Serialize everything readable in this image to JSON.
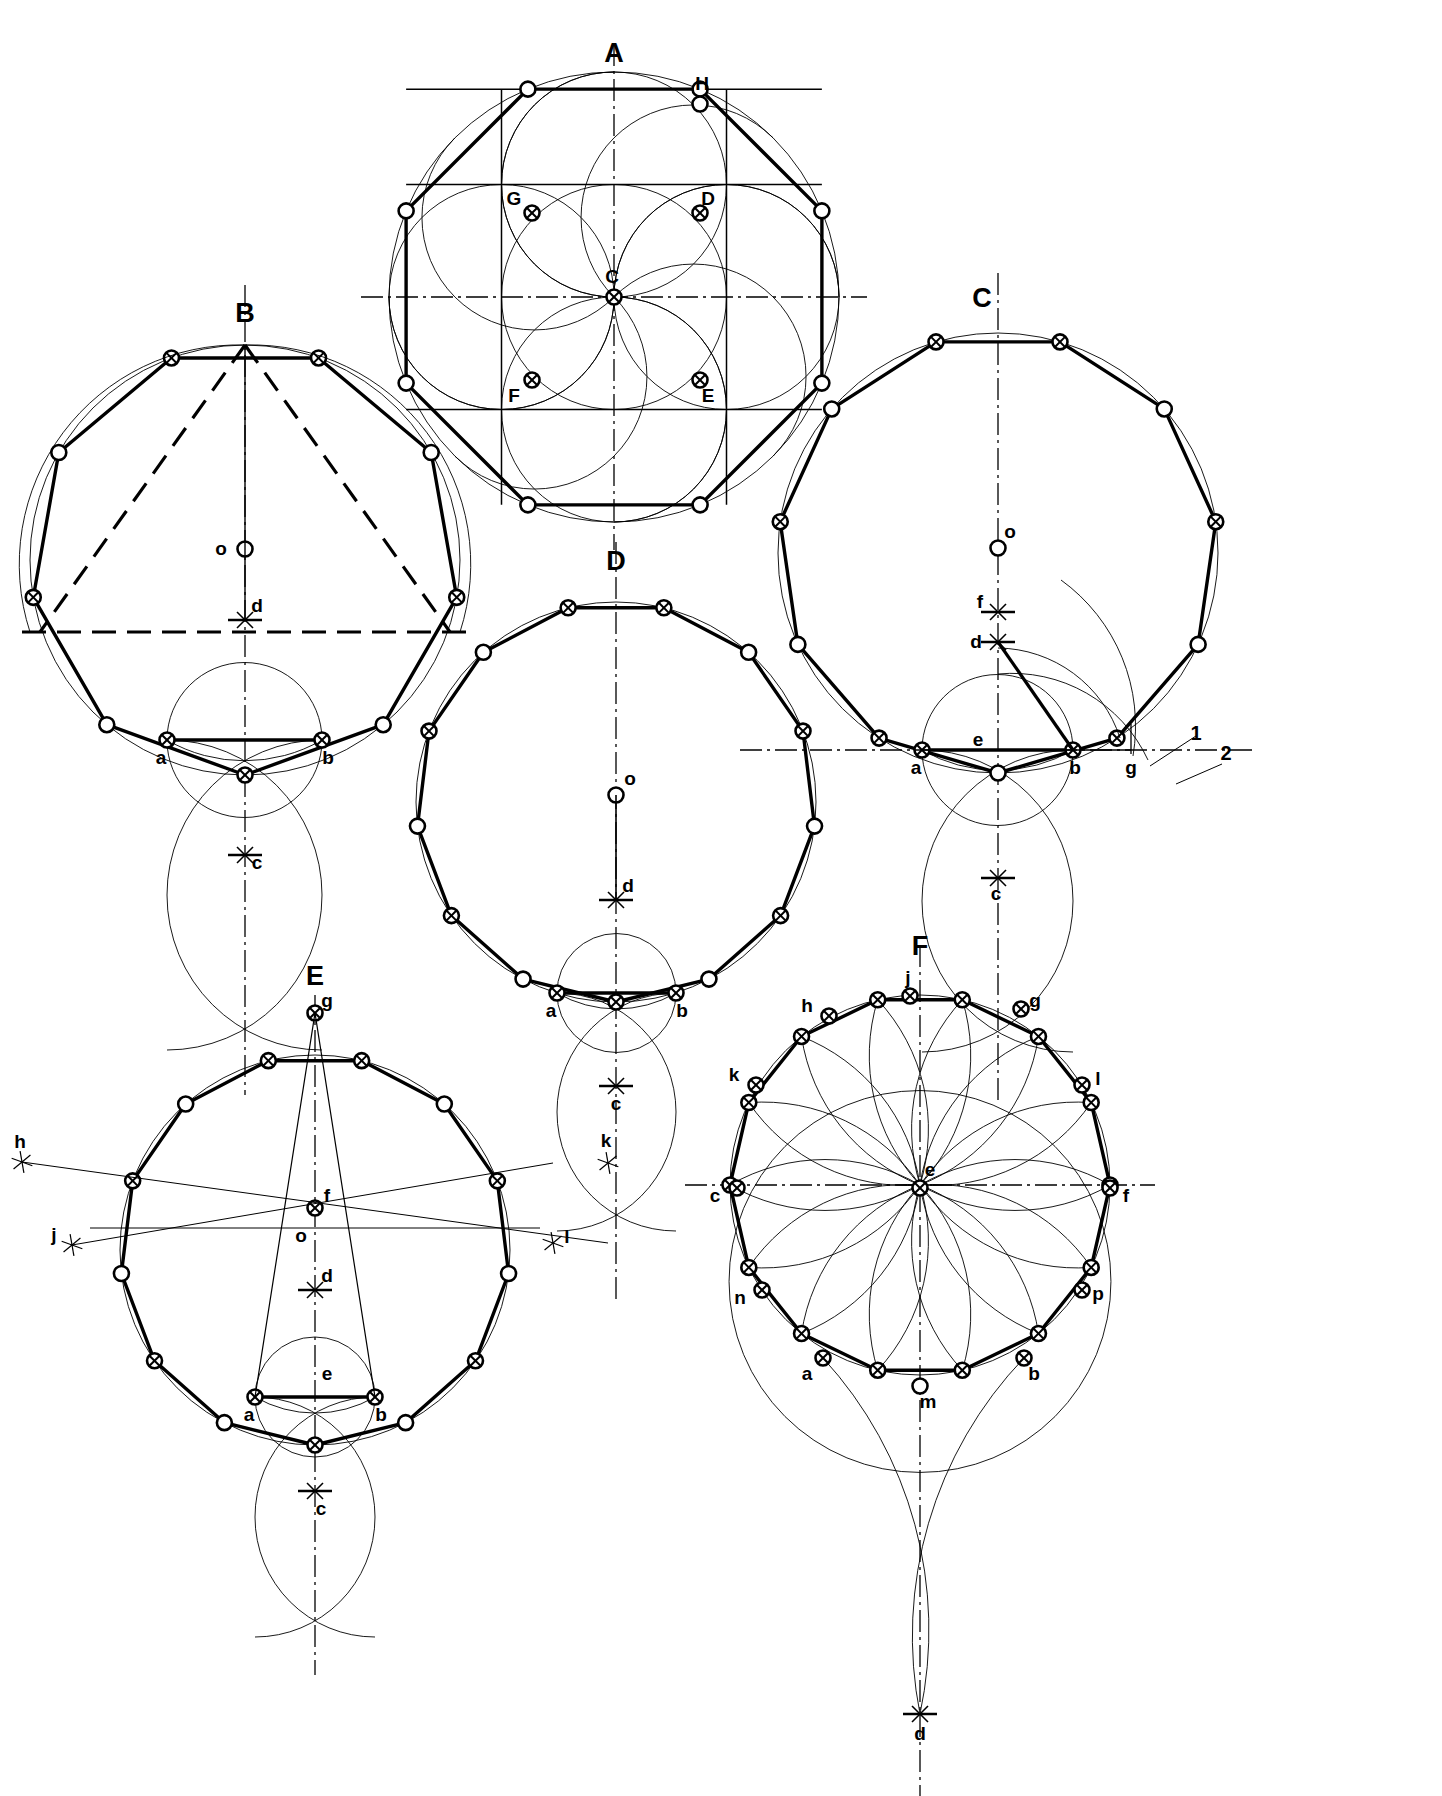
{
  "sheet": {
    "title_visible": false,
    "background": "#ffffff",
    "ink": "#000000",
    "width": 1442,
    "height": 1796,
    "description": "Technical drawing plate: six geometric constructions of regular polygons inscribed in circles, labelled A through F."
  },
  "figures": [
    {
      "id": "A",
      "label": "A",
      "label_pos": [
        614,
        62
      ],
      "polygon_sides": 8,
      "center": [
        614,
        297
      ],
      "radius": 225,
      "rotation_deg": 22.5,
      "construction": "octagon-in-circle-with-square-and-rosette",
      "points": [
        {
          "name": "C",
          "label": "C",
          "x": 614,
          "y": 297,
          "label_dx": -2,
          "label_dy": -14,
          "marker": "crossed"
        },
        {
          "name": "D",
          "label": "D",
          "x": 700,
          "y": 213,
          "label_dx": 8,
          "label_dy": -8,
          "marker": "crossed"
        },
        {
          "name": "E",
          "label": "E",
          "x": 700,
          "y": 380,
          "label_dx": 8,
          "label_dy": 22,
          "marker": "crossed"
        },
        {
          "name": "F",
          "label": "F",
          "x": 532,
          "y": 380,
          "label_dx": -18,
          "label_dy": 22,
          "marker": "crossed"
        },
        {
          "name": "G",
          "label": "G",
          "x": 532,
          "y": 213,
          "label_dx": -18,
          "label_dy": -8,
          "marker": "crossed"
        },
        {
          "name": "H",
          "label": "H",
          "x": 700,
          "y": 104,
          "label_dx": 2,
          "label_dy": -14,
          "marker": "open"
        }
      ]
    },
    {
      "id": "B",
      "label": "B",
      "label_pos": [
        245,
        322
      ],
      "polygon_sides": 9,
      "center": [
        245,
        560
      ],
      "radius": 215,
      "rotation_deg": -90,
      "construction": "nonagon-from-base-ab-and-arc-intersections",
      "points": [
        {
          "name": "o",
          "label": "o",
          "x": 245,
          "y": 549,
          "label_dx": -24,
          "label_dy": 6,
          "marker": "open"
        },
        {
          "name": "d",
          "label": "d",
          "x": 245,
          "y": 620,
          "label_dx": 12,
          "label_dy": -8,
          "marker": "cross-tick"
        },
        {
          "name": "a",
          "label": "a",
          "x": 167,
          "y": 740,
          "label_dx": -6,
          "label_dy": 24,
          "marker": "crossed"
        },
        {
          "name": "b",
          "label": "b",
          "x": 322,
          "y": 740,
          "label_dx": 6,
          "label_dy": 24,
          "marker": "crossed"
        },
        {
          "name": "c",
          "label": "c",
          "x": 245,
          "y": 855,
          "label_dx": 12,
          "label_dy": 14,
          "marker": "cross-tick"
        }
      ]
    },
    {
      "id": "C",
      "label": "C",
      "label_pos": [
        982,
        307
      ],
      "polygon_sides": 11,
      "center": [
        998,
        553
      ],
      "radius": 220,
      "rotation_deg": -90,
      "construction": "hendecagon-with-angle-bisector-and-numbered-arcs",
      "points": [
        {
          "name": "o",
          "label": "o",
          "x": 998,
          "y": 548,
          "label_dx": 12,
          "label_dy": -10,
          "marker": "open"
        },
        {
          "name": "f",
          "label": "f",
          "x": 998,
          "y": 612,
          "label_dx": -18,
          "label_dy": -4,
          "marker": "cross-tick"
        },
        {
          "name": "d",
          "label": "d",
          "x": 998,
          "y": 642,
          "label_dx": -22,
          "label_dy": 6,
          "marker": "cross-tick"
        },
        {
          "name": "e",
          "label": "e",
          "x": 998,
          "y": 750,
          "label_dx": -20,
          "label_dy": -4,
          "marker": "none"
        },
        {
          "name": "a",
          "label": "a",
          "x": 922,
          "y": 750,
          "label_dx": -6,
          "label_dy": 24,
          "marker": "crossed"
        },
        {
          "name": "b",
          "label": "b",
          "x": 1073,
          "y": 750,
          "label_dx": 2,
          "label_dy": 24,
          "marker": "crossed"
        },
        {
          "name": "g",
          "label": "g",
          "x": 1131,
          "y": 750,
          "label_dx": 0,
          "label_dy": 24,
          "marker": "none"
        },
        {
          "name": "c",
          "label": "c",
          "x": 998,
          "y": 878,
          "label_dx": -2,
          "label_dy": 22,
          "marker": "cross-tick"
        }
      ],
      "annotations": [
        {
          "name": "1",
          "label": "1",
          "x": 1196,
          "y": 740
        },
        {
          "name": "2",
          "label": "2",
          "x": 1226,
          "y": 760
        }
      ]
    },
    {
      "id": "D",
      "label": "D",
      "label_pos": [
        616,
        570
      ],
      "polygon_sides": 13,
      "center": [
        616,
        802
      ],
      "radius": 200,
      "rotation_deg": -90,
      "construction": "tridecagon-from-base-ab",
      "points": [
        {
          "name": "o",
          "label": "o",
          "x": 616,
          "y": 795,
          "label_dx": 14,
          "label_dy": -10,
          "marker": "open"
        },
        {
          "name": "d",
          "label": "d",
          "x": 616,
          "y": 900,
          "label_dx": 12,
          "label_dy": -8,
          "marker": "cross-tick"
        },
        {
          "name": "a",
          "label": "a",
          "x": 557,
          "y": 993,
          "label_dx": -6,
          "label_dy": 24,
          "marker": "crossed"
        },
        {
          "name": "b",
          "label": "b",
          "x": 676,
          "y": 993,
          "label_dx": 6,
          "label_dy": 24,
          "marker": "crossed"
        },
        {
          "name": "c",
          "label": "c",
          "x": 616,
          "y": 1086,
          "label_dx": 0,
          "label_dy": 24,
          "marker": "cross-tick"
        }
      ]
    },
    {
      "id": "E",
      "label": "E",
      "label_pos": [
        315,
        985
      ],
      "polygon_sides": 13,
      "center": [
        315,
        1250
      ],
      "radius": 195,
      "rotation_deg": -90,
      "construction": "polygon-with-external-ray-marks-h-j-k-l",
      "points": [
        {
          "name": "g",
          "label": "g",
          "x": 315,
          "y": 1013,
          "label_dx": 12,
          "label_dy": -6,
          "marker": "crossed"
        },
        {
          "name": "f",
          "label": "f",
          "x": 315,
          "y": 1208,
          "label_dx": 12,
          "label_dy": -6,
          "marker": "crossed"
        },
        {
          "name": "o",
          "label": "o",
          "x": 315,
          "y": 1228,
          "label_dx": -14,
          "label_dy": 14,
          "marker": "none"
        },
        {
          "name": "d",
          "label": "d",
          "x": 315,
          "y": 1290,
          "label_dx": 12,
          "label_dy": -8,
          "marker": "cross-tick"
        },
        {
          "name": "e",
          "label": "e",
          "x": 315,
          "y": 1382,
          "label_dx": 12,
          "label_dy": -2,
          "marker": "none"
        },
        {
          "name": "a",
          "label": "a",
          "x": 255,
          "y": 1397,
          "label_dx": -6,
          "label_dy": 24,
          "marker": "crossed"
        },
        {
          "name": "b",
          "label": "b",
          "x": 375,
          "y": 1397,
          "label_dx": 6,
          "label_dy": 24,
          "marker": "crossed"
        },
        {
          "name": "c",
          "label": "c",
          "x": 315,
          "y": 1491,
          "label_dx": 6,
          "label_dy": 24,
          "marker": "cross-tick"
        },
        {
          "name": "h",
          "label": "h",
          "x": 22,
          "y": 1162,
          "label_dx": -2,
          "label_dy": -14,
          "marker": "star"
        },
        {
          "name": "j",
          "label": "j",
          "x": 72,
          "y": 1245,
          "label_dx": -18,
          "label_dy": -4,
          "marker": "star"
        },
        {
          "name": "k",
          "label": "k",
          "x": 608,
          "y": 1163,
          "label_dx": -2,
          "label_dy": -16,
          "marker": "star"
        },
        {
          "name": "l",
          "label": "l",
          "x": 553,
          "y": 1243,
          "label_dx": 14,
          "label_dy": 0,
          "marker": "star"
        }
      ]
    },
    {
      "id": "F",
      "label": "F",
      "label_pos": [
        920,
        955
      ],
      "polygon_sides": 14,
      "center": [
        920,
        1185
      ],
      "radius": 190,
      "rotation_deg": -90,
      "construction": "tetradecagon-rosette-from-centre-e",
      "points": [
        {
          "name": "j",
          "label": "j",
          "x": 910,
          "y": 996,
          "label_dx": -2,
          "label_dy": -12,
          "marker": "crossed"
        },
        {
          "name": "h",
          "label": "h",
          "x": 829,
          "y": 1016,
          "label_dx": -22,
          "label_dy": -4,
          "marker": "crossed"
        },
        {
          "name": "g",
          "label": "g",
          "x": 1021,
          "y": 1009,
          "label_dx": 14,
          "label_dy": -2,
          "marker": "crossed"
        },
        {
          "name": "k",
          "label": "k",
          "x": 756,
          "y": 1085,
          "label_dx": -22,
          "label_dy": -4,
          "marker": "crossed"
        },
        {
          "name": "l",
          "label": "l",
          "x": 1082,
          "y": 1085,
          "label_dx": 16,
          "label_dy": 0,
          "marker": "crossed"
        },
        {
          "name": "c",
          "label": "c",
          "x": 737,
          "y": 1188,
          "label_dx": -22,
          "label_dy": 14,
          "marker": "crossed"
        },
        {
          "name": "f",
          "label": "f",
          "x": 1110,
          "y": 1188,
          "label_dx": 16,
          "label_dy": 14,
          "marker": "crossed"
        },
        {
          "name": "e",
          "label": "e",
          "x": 920,
          "y": 1188,
          "label_dx": 10,
          "label_dy": -12,
          "marker": "crossed"
        },
        {
          "name": "n",
          "label": "n",
          "x": 762,
          "y": 1290,
          "label_dx": -22,
          "label_dy": 14,
          "marker": "crossed"
        },
        {
          "name": "p",
          "label": "p",
          "x": 1082,
          "y": 1290,
          "label_dx": 16,
          "label_dy": 10,
          "marker": "crossed"
        },
        {
          "name": "a",
          "label": "a",
          "x": 823,
          "y": 1358,
          "label_dx": -16,
          "label_dy": 22,
          "marker": "crossed"
        },
        {
          "name": "b",
          "label": "b",
          "x": 1024,
          "y": 1358,
          "label_dx": 10,
          "label_dy": 22,
          "marker": "crossed"
        },
        {
          "name": "m",
          "label": "m",
          "x": 920,
          "y": 1386,
          "label_dx": 8,
          "label_dy": 22,
          "marker": "open"
        },
        {
          "name": "d",
          "label": "d",
          "x": 920,
          "y": 1714,
          "label_dx": 0,
          "label_dy": 26,
          "marker": "cross-tick"
        }
      ]
    }
  ],
  "legend": {
    "figure_letters": [
      "A",
      "B",
      "C",
      "D",
      "E",
      "F"
    ],
    "point_letters_lower": [
      "a",
      "b",
      "c",
      "d",
      "e",
      "f",
      "g",
      "h",
      "j",
      "k",
      "l",
      "m",
      "n",
      "o",
      "p"
    ],
    "point_letters_upper": [
      "C",
      "D",
      "E",
      "F",
      "G",
      "H"
    ],
    "numbers": [
      "1",
      "2"
    ]
  }
}
